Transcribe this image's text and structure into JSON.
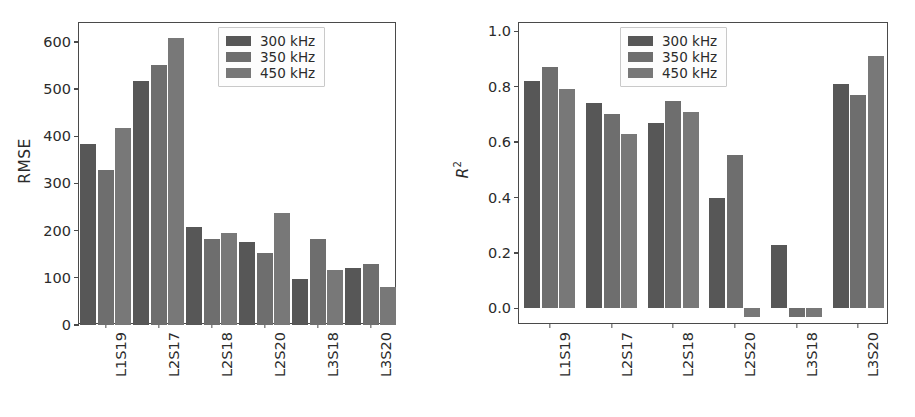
{
  "figure": {
    "background": "#ffffff",
    "panels": [
      "rmse",
      "r2"
    ]
  },
  "series_colors": {
    "300 kHz": "#575757",
    "350 kHz": "#6e6e6e",
    "450 kHz": "#787878"
  },
  "legend": {
    "entries": [
      {
        "label": "300 kHz",
        "color": "#575757"
      },
      {
        "label": "350 kHz",
        "color": "#6e6e6e"
      },
      {
        "label": "450 kHz",
        "color": "#787878"
      }
    ]
  },
  "chart_data": [
    {
      "id": "rmse",
      "type": "bar",
      "title": "",
      "xlabel": "",
      "ylabel": "RMSE",
      "ylim": [
        0,
        640
      ],
      "yticks": [
        0,
        100,
        200,
        300,
        400,
        500,
        600
      ],
      "ytick_labels": [
        "0",
        "100",
        "200",
        "300",
        "400",
        "500",
        "600"
      ],
      "grid": false,
      "legend_position": "upper right",
      "categories": [
        "L1S19",
        "L2S17",
        "L2S18",
        "L2S20",
        "L3S18",
        "L3S20"
      ],
      "series": [
        {
          "name": "300 kHz",
          "color": "#575757",
          "values": [
            383,
            518,
            208,
            175,
            97,
            120
          ]
        },
        {
          "name": "350 kHz",
          "color": "#6e6e6e",
          "values": [
            329,
            550,
            182,
            152,
            183,
            130
          ]
        },
        {
          "name": "450 kHz",
          "color": "#787878",
          "values": [
            418,
            609,
            195,
            238,
            117,
            80
          ]
        }
      ]
    },
    {
      "id": "r2",
      "type": "bar",
      "title": "",
      "xlabel": "",
      "ylabel": "R2",
      "ylabel_display": "R",
      "ylabel_sup": "2",
      "ylim": [
        -0.06,
        1.03
      ],
      "yticks": [
        0.0,
        0.2,
        0.4,
        0.6,
        0.8,
        1.0
      ],
      "ytick_labels": [
        "0.0",
        "0.2",
        "0.4",
        "0.6",
        "0.8",
        "1.0"
      ],
      "grid": false,
      "legend_position": "upper center",
      "categories": [
        "L1S19",
        "L2S17",
        "L2S18",
        "L2S20",
        "L3S18",
        "L3S20"
      ],
      "series": [
        {
          "name": "300 kHz",
          "color": "#575757",
          "values": [
            0.82,
            0.74,
            0.67,
            0.4,
            0.23,
            0.81
          ]
        },
        {
          "name": "350 kHz",
          "color": "#6e6e6e",
          "values": [
            0.87,
            0.7,
            0.75,
            0.555,
            -0.03,
            0.77
          ]
        },
        {
          "name": "450 kHz",
          "color": "#787878",
          "values": [
            0.79,
            0.63,
            0.71,
            -0.03,
            -0.03,
            0.91
          ]
        }
      ]
    }
  ]
}
